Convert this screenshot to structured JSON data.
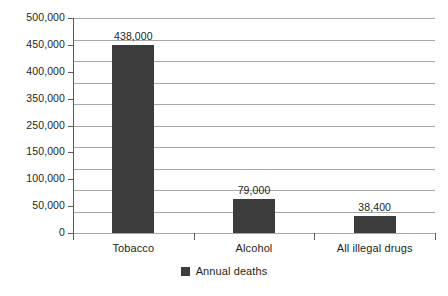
{
  "chart_data": {
    "type": "bar",
    "title": "",
    "xlabel": "",
    "ylabel": "",
    "categories": [
      "Tobacco",
      "Alcohol",
      "All illegal drugs"
    ],
    "values": [
      438000,
      79000,
      38400
    ],
    "value_labels": [
      "438,000",
      "79,000",
      "38,400"
    ],
    "series": [
      {
        "name": "Annual deaths",
        "values": [
          438000,
          79000,
          38400
        ],
        "color": "#3c3c3c"
      }
    ],
    "ylim": [
      0,
      500000
    ],
    "ytick_values": [
      500000,
      450000,
      400000,
      350000,
      250000,
      150000,
      100000,
      50000,
      0
    ],
    "ytick_labels": [
      "500,000",
      "450,000",
      "400,000",
      "350,000",
      "250,000",
      "150,000",
      "100,000",
      "50,000",
      "0"
    ],
    "gridline_count": 11,
    "grid": true,
    "legend": {
      "position": "bottom",
      "entries": [
        {
          "label": "Annual deaths",
          "swatch_name": "legend-swatch-annual-deaths"
        }
      ]
    },
    "colors": {
      "bar": "#3c3c3c",
      "gridline": "#a8a8a8",
      "axis": "#5a5a5a",
      "text": "#231f20",
      "background": "#ffffff"
    }
  },
  "caption_sliver": "",
  "axis": {
    "y_label_template": "",
    "category_axis_name": "category-axis"
  }
}
